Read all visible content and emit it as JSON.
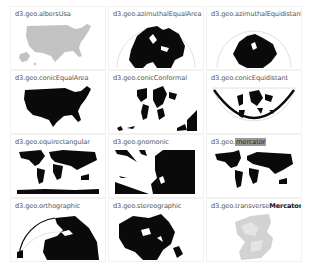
{
  "search": {
    "query": "mercator"
  },
  "projections": [
    {
      "prefix": "d3.geo.",
      "name": "albersUsa",
      "highlight": "",
      "highlight_style": "",
      "suffix": "",
      "map": "usa-gray"
    },
    {
      "prefix": "d3.geo.",
      "name": "azimuthalEqualArea",
      "highlight": "",
      "highlight_style": "",
      "suffix": "",
      "map": "globe-half"
    },
    {
      "prefix": "d3.geo.",
      "name": "azimuthalEquidistant",
      "highlight": "",
      "highlight_style": "",
      "suffix": "",
      "map": "globe-half-small"
    },
    {
      "prefix": "d3.geo.",
      "name": "conicEqualArea",
      "highlight": "",
      "highlight_style": "",
      "suffix": "",
      "map": "usa-black"
    },
    {
      "prefix": "d3.geo.",
      "name": "conicConformal",
      "highlight": "",
      "highlight_style": "",
      "suffix": "",
      "map": "world-conic"
    },
    {
      "prefix": "d3.geo.",
      "name": "conicEquidistant",
      "highlight": "",
      "highlight_style": "",
      "suffix": "",
      "map": "world-fan"
    },
    {
      "prefix": "d3.geo.",
      "name": "equirectangular",
      "highlight": "",
      "highlight_style": "",
      "suffix": "",
      "map": "world-flat"
    },
    {
      "prefix": "d3.geo.",
      "name": "gnomonic",
      "highlight": "",
      "highlight_style": "",
      "suffix": "",
      "map": "gnomonic"
    },
    {
      "prefix": "d3.geo.",
      "name": "",
      "highlight": "mercator",
      "highlight_style": "hl",
      "suffix": "",
      "map": "world-mercator"
    },
    {
      "prefix": "d3.geo.",
      "name": "orthographic",
      "highlight": "",
      "highlight_style": "",
      "suffix": "",
      "map": "globe-ortho"
    },
    {
      "prefix": "d3.geo.",
      "name": "stereographic",
      "highlight": "",
      "highlight_style": "",
      "suffix": "",
      "map": "stereo"
    },
    {
      "prefix": "d3.geo.",
      "name": "transverse",
      "highlight": "Mercator",
      "highlight_style": "bold",
      "suffix": "",
      "map": "transverse-gray"
    }
  ],
  "colors": {
    "land": "#0a0a0a",
    "land_gray": "#bdbdbd",
    "outline": "#d8d8d8",
    "label": "#555555",
    "highlight_bg": "#9a9a9a"
  }
}
